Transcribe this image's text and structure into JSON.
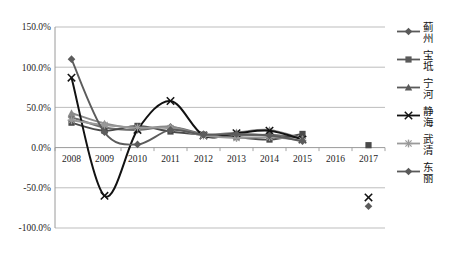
{
  "chart_data": {
    "type": "line",
    "title": "",
    "xlabel": "",
    "ylabel": "",
    "categories": [
      "2008",
      "2009",
      "2010",
      "2011",
      "2012",
      "2013",
      "2014",
      "2015",
      "2016",
      "2017"
    ],
    "x_ticks": [
      "2008",
      "2009",
      "2010",
      "2011",
      "2012",
      "2013",
      "2014",
      "2015",
      "2016",
      "2017"
    ],
    "y_ticks": [
      "150.0%",
      "100.0%",
      "50.0%",
      "0.0%",
      "-50.0%",
      "-100.0%"
    ],
    "y_tick_values": [
      150,
      100,
      50,
      0,
      -50,
      -100
    ],
    "ylim": [
      -100,
      150
    ],
    "y_unit": "%",
    "grid": "horizontal",
    "legend_position": "right",
    "smoothed": true,
    "series": [
      {
        "name": "蓟州",
        "marker": "diamond",
        "color": "#6e6e6e",
        "values": [
          38,
          25,
          22,
          26,
          17,
          15,
          16,
          12,
          null,
          null
        ]
      },
      {
        "name": "宝坻",
        "marker": "square",
        "color": "#4a4a4a",
        "values": [
          31,
          21,
          27,
          20,
          16,
          13,
          10,
          17,
          null,
          3
        ]
      },
      {
        "name": "宁河",
        "marker": "triangle",
        "color": "#8a8a8a",
        "values": [
          43,
          30,
          24,
          26,
          16,
          19,
          22,
          11,
          null,
          null
        ]
      },
      {
        "name": "静海",
        "marker": "x",
        "color": "#121212",
        "values": [
          87,
          -60,
          22,
          58,
          15,
          18,
          21,
          10,
          null,
          -62
        ]
      },
      {
        "name": "武清",
        "marker": "star",
        "color": "#9a9a9a",
        "values": [
          34,
          28,
          25,
          24,
          15,
          12,
          13,
          9,
          null,
          null
        ]
      },
      {
        "name": "东丽",
        "marker": "diamond",
        "color": "#5c5c5c",
        "values": [
          110,
          19,
          4,
          22,
          16,
          17,
          15,
          8,
          null,
          -73
        ]
      }
    ]
  },
  "legend": {
    "items": [
      {
        "label": "蓟州",
        "marker": "diamond-marker-icon"
      },
      {
        "label": "宝坻",
        "marker": "square-marker-icon"
      },
      {
        "label": "宁河",
        "marker": "triangle-marker-icon"
      },
      {
        "label": "静海",
        "marker": "x-marker-icon"
      },
      {
        "label": "武清",
        "marker": "star-marker-icon"
      },
      {
        "label": "东丽",
        "marker": "diamond-marker-icon"
      }
    ]
  }
}
